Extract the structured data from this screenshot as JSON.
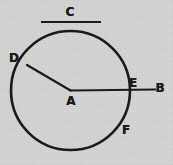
{
  "figure": {
    "canvas": {
      "width": 173,
      "height": 165
    },
    "background_color": "#d6d6d6",
    "ink_color": "#1a1a1a"
  },
  "circle": {
    "center_x": 70.5,
    "center_y": 90.5,
    "radius": 59.5,
    "stroke_width": 2.6
  },
  "segments": [
    {
      "name": "radius-line-AD",
      "x1": 70.5,
      "y1": 90.5,
      "x2": 27.0,
      "y2": 65.0,
      "stroke_width": 2.2
    },
    {
      "name": "ray-line-AB",
      "x1": 70.5,
      "y1": 90.5,
      "x2": 156.0,
      "y2": 89.5,
      "stroke_width": 2.2
    },
    {
      "name": "top-segment-C",
      "x1": 41.0,
      "y1": 22.0,
      "x2": 101.0,
      "y2": 22.0,
      "stroke_width": 2.2
    }
  ],
  "labels": [
    {
      "id": "label-c",
      "text": "C",
      "x": 70,
      "y": 12
    },
    {
      "id": "label-d",
      "text": "D",
      "x": 14,
      "y": 58
    },
    {
      "id": "label-a",
      "text": "A",
      "x": 71,
      "y": 101
    },
    {
      "id": "label-e",
      "text": "E",
      "x": 133,
      "y": 83
    },
    {
      "id": "label-b",
      "text": "B",
      "x": 160,
      "y": 88
    },
    {
      "id": "label-f",
      "text": "F",
      "x": 126,
      "y": 130
    }
  ]
}
